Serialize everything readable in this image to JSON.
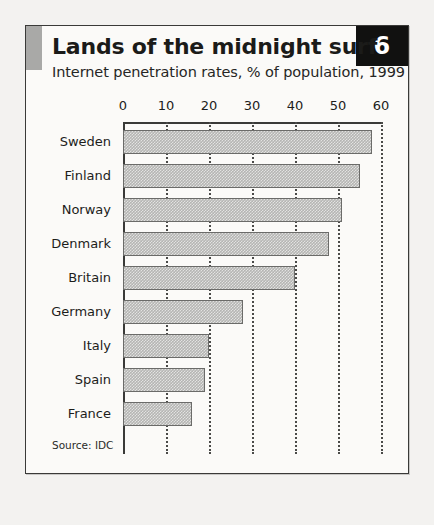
{
  "chart_data": {
    "type": "bar",
    "orientation": "horizontal",
    "title": "Lands of the midnight surf",
    "subtitle": "Internet penetration rates, % of population, 1999",
    "badge": "6",
    "source": "Source: IDC",
    "xlabel": "",
    "ylabel": "",
    "xlim": [
      0,
      60
    ],
    "ticks": [
      0,
      10,
      20,
      30,
      40,
      50,
      60
    ],
    "grid": "vertical-dotted",
    "legend": "none",
    "categories": [
      "Sweden",
      "Finland",
      "Norway",
      "Denmark",
      "Britain",
      "Germany",
      "Italy",
      "Spain",
      "France"
    ],
    "values": [
      58,
      55,
      51,
      48,
      40,
      28,
      20,
      19,
      16
    ],
    "bars": [
      {
        "label": "Sweden",
        "value": 58
      },
      {
        "label": "Finland",
        "value": 55
      },
      {
        "label": "Norway",
        "value": 51
      },
      {
        "label": "Denmark",
        "value": 48
      },
      {
        "label": "Britain",
        "value": 40
      },
      {
        "label": "Germany",
        "value": 28
      },
      {
        "label": "Italy",
        "value": 20
      },
      {
        "label": "Spain",
        "value": 19
      },
      {
        "label": "France",
        "value": 16
      }
    ]
  },
  "colors": {
    "page_background": "#f3f2f0",
    "panel_background": "#fbfaf8",
    "frame": "#3a3a38",
    "accent_block": "#a9a9a7",
    "badge_background": "#111110",
    "badge_text": "#ffffff",
    "bar_fill": "#b5b5b3",
    "bar_border": "#6b6b69",
    "text": "#1d1d1b",
    "gridline": "#4a4a48"
  }
}
